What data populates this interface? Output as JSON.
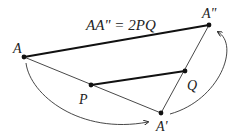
{
  "diagram": {
    "equation": "AA\" = 2PQ",
    "points": [
      {
        "id": "A",
        "label": "A",
        "x": 24,
        "y": 57
      },
      {
        "id": "A2",
        "label": "A\"",
        "x": 209,
        "y": 25
      },
      {
        "id": "Q",
        "label": "Q",
        "x": 185,
        "y": 71
      },
      {
        "id": "P",
        "label": "P",
        "x": 91,
        "y": 85
      },
      {
        "id": "A1",
        "label": "A'",
        "x": 161,
        "y": 113
      }
    ],
    "segments": [
      {
        "from": "A",
        "to": "A2",
        "style": "thick"
      },
      {
        "from": "P",
        "to": "Q",
        "style": "thick"
      },
      {
        "from": "A",
        "to": "A1",
        "style": "thin"
      },
      {
        "from": "A1",
        "to": "A2",
        "style": "thin"
      }
    ],
    "arrows": [
      {
        "from": "A",
        "to": "A1",
        "description": "curved arrow from A to A'"
      },
      {
        "from": "A1",
        "to": "A2",
        "description": "curved arrow from A' to A\""
      }
    ],
    "colors": {
      "stroke": "#222222",
      "background": "#ffffff"
    }
  }
}
